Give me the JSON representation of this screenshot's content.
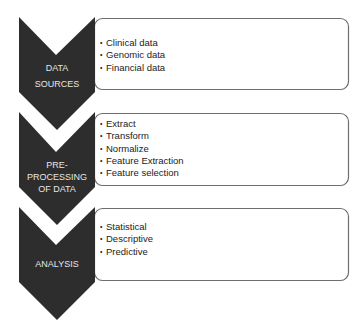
{
  "diagram": {
    "colors": {
      "chevron_fill": "#2d2d2d",
      "chevron_text": "#e6e6e6",
      "box_border": "#6e6e6e",
      "box_fill": "#ffffff",
      "item_text": "#222222"
    },
    "bullet_glyph": "•",
    "stages": [
      {
        "label_lines": [
          "DATA",
          "SOURCES"
        ],
        "items": [
          "Clinical data",
          "Genomic data",
          "Financial data"
        ]
      },
      {
        "label_lines": [
          "PRE-PROCESSING",
          "OF DATA"
        ],
        "items": [
          "Extract",
          "Transform",
          "Normalize",
          "Feature Extraction",
          "Feature selection"
        ]
      },
      {
        "label_lines": [
          "ANALYSIS"
        ],
        "items": [
          "Statistical",
          "Descriptive",
          "Predictive"
        ]
      }
    ]
  }
}
